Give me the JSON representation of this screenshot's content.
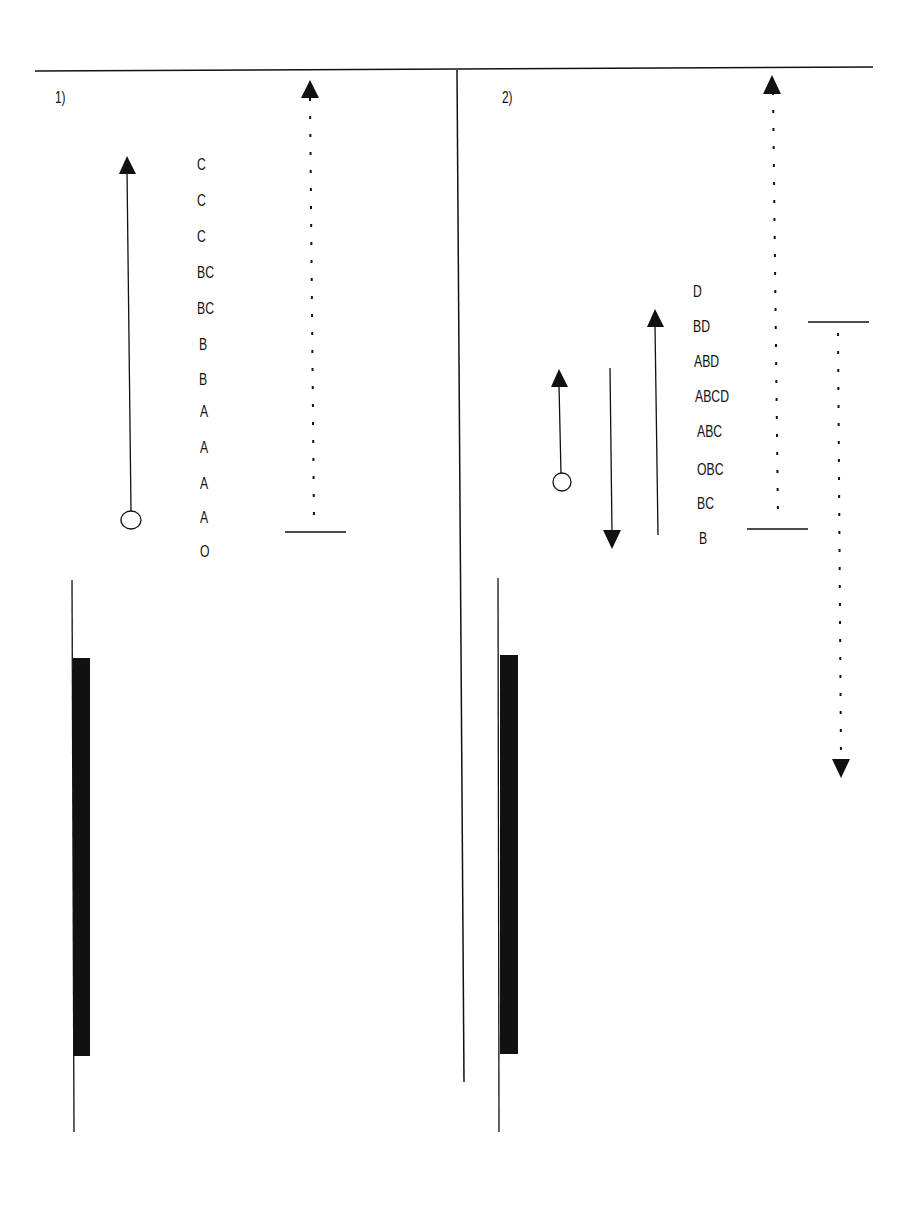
{
  "panels": [
    {
      "label": "1)",
      "stack_labels": [
        "C",
        "C",
        "C",
        "BC",
        "BC",
        "B",
        "B",
        "A",
        "A",
        "A",
        "A",
        "O"
      ]
    },
    {
      "label": "2)",
      "stack_labels": [
        "D",
        "BD",
        "ABD",
        "ABCD",
        "ABC",
        "OBC",
        "BC",
        "B"
      ]
    }
  ],
  "colors": {
    "ink": "#111111",
    "background": "#ffffff"
  }
}
